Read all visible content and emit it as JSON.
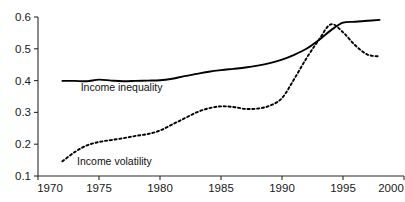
{
  "chart_data": {
    "type": "line",
    "title": "",
    "xlabel": "",
    "ylabel": "",
    "xlim": [
      1970,
      2000
    ],
    "ylim": [
      0.1,
      0.6
    ],
    "grid": false,
    "legend_position": "inline-labels",
    "x_ticks": [
      "1970",
      "1975",
      "1980",
      "1985",
      "1990",
      "1995",
      "2000"
    ],
    "y_ticks": [
      "0.1",
      "0.2",
      "0.3",
      "0.4",
      "0.5",
      "0.6"
    ],
    "series": [
      {
        "name": "Income inequality",
        "style": "solid",
        "color": "#000000",
        "label_x": 1973.5,
        "label_y": 0.368,
        "x": [
          1972,
          1973,
          1974,
          1975,
          1976,
          1977,
          1978,
          1979,
          1980,
          1981,
          1982,
          1983,
          1984,
          1985,
          1986,
          1987,
          1988,
          1989,
          1990,
          1991,
          1992,
          1993,
          1994,
          1995,
          1996,
          1997,
          1998
        ],
        "values": [
          0.399,
          0.399,
          0.398,
          0.403,
          0.4,
          0.398,
          0.399,
          0.4,
          0.401,
          0.406,
          0.414,
          0.421,
          0.428,
          0.433,
          0.437,
          0.441,
          0.447,
          0.455,
          0.466,
          0.481,
          0.5,
          0.527,
          0.558,
          0.582,
          0.585,
          0.588,
          0.591
        ]
      },
      {
        "name": "Income volatility",
        "style": "dotted",
        "color": "#000000",
        "label_x": 1973.2,
        "label_y": 0.135,
        "x": [
          1972,
          1973,
          1974,
          1975,
          1976,
          1977,
          1978,
          1979,
          1980,
          1981,
          1982,
          1983,
          1984,
          1985,
          1986,
          1987,
          1988,
          1989,
          1990,
          1991,
          1992,
          1993,
          1994,
          1995,
          1996,
          1997,
          1998
        ],
        "values": [
          0.146,
          0.175,
          0.196,
          0.207,
          0.213,
          0.219,
          0.226,
          0.232,
          0.243,
          0.262,
          0.281,
          0.3,
          0.313,
          0.319,
          0.317,
          0.311,
          0.312,
          0.321,
          0.345,
          0.405,
          0.47,
          0.527,
          0.577,
          0.552,
          0.511,
          0.482,
          0.476
        ]
      }
    ]
  },
  "ghost_marks": [
    {
      "text": "·",
      "x": 195,
      "y": 6
    },
    {
      "text": "·",
      "x": 230,
      "y": 6
    }
  ]
}
